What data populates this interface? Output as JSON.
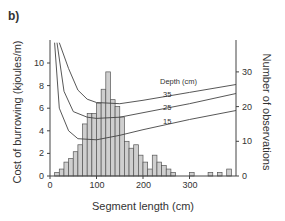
{
  "panel_label": "b)",
  "chart_data": {
    "type": "bar",
    "title": "",
    "xlabel": "Segment length (cm)",
    "ylabel": "Cost of burrowing (kjoules/m)",
    "ylabel_right": "Number of observations",
    "xlim": [
      0,
      400
    ],
    "ylim": [
      0,
      12
    ],
    "ylim_right": [
      0,
      36
    ],
    "xticks": [
      0,
      100,
      200,
      300
    ],
    "yticks": [
      0,
      2,
      4,
      6,
      8,
      10
    ],
    "yticks_right": [
      0,
      10,
      20,
      30
    ],
    "histogram": {
      "name": "Number of observations",
      "bin_width_cm": 10,
      "bin_starts": [
        10,
        20,
        30,
        40,
        50,
        60,
        70,
        80,
        90,
        100,
        110,
        120,
        130,
        140,
        150,
        160,
        170,
        180,
        190,
        200,
        210,
        220,
        230,
        240,
        250,
        260,
        270,
        280,
        290,
        300,
        310,
        320,
        330,
        340,
        350,
        360,
        370,
        380,
        390
      ],
      "values": [
        1,
        2,
        4,
        5,
        7,
        9,
        15,
        18,
        18,
        21,
        25,
        30,
        22,
        20,
        17,
        10,
        8,
        9,
        6,
        4,
        2,
        6,
        4,
        3,
        2,
        1,
        0,
        0,
        0,
        1,
        0,
        0,
        0,
        1,
        0,
        1,
        0,
        2,
        0
      ],
      "fill": "#cfcfcf"
    },
    "curves_legend_title": "Depth (cm)",
    "series": [
      {
        "name": "35",
        "x": [
          20,
          40,
          60,
          80,
          100,
          150,
          200,
          300,
          400
        ],
        "values": [
          12,
          9.5,
          7.6,
          6.8,
          6.5,
          6.4,
          6.7,
          7.4,
          8.1
        ]
      },
      {
        "name": "25",
        "x": [
          15,
          30,
          50,
          80,
          100,
          150,
          200,
          300,
          400
        ],
        "values": [
          12,
          7.5,
          5.7,
          5.2,
          5.1,
          5.2,
          5.6,
          6.4,
          7.3
        ]
      },
      {
        "name": "15",
        "x": [
          10,
          20,
          40,
          60,
          100,
          150,
          200,
          300,
          400
        ],
        "values": [
          12,
          6.0,
          4.0,
          3.3,
          3.2,
          3.6,
          4.1,
          5.0,
          5.8
        ]
      }
    ],
    "grid": false
  },
  "labels": {
    "legend_title": "Depth (cm)",
    "curve_35": "35",
    "curve_25": "25",
    "curve_15": "15",
    "x_axis": "Segment length (cm)",
    "y_axis_left": "Cost of burrowing (kjoules/m)",
    "y_axis_right": "Number of observations",
    "xt0": "0",
    "xt100": "100",
    "xt200": "200",
    "xt300": "300",
    "yl0": "0",
    "yl2": "2",
    "yl4": "4",
    "yl6": "6",
    "yl8": "8",
    "yl10": "10",
    "yr0": "0",
    "yr10": "10",
    "yr20": "20",
    "yr30": "30"
  }
}
